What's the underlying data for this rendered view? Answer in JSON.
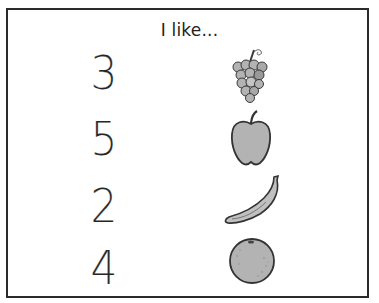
{
  "worksheet": {
    "title": "I like...",
    "rows": [
      {
        "number": "3",
        "fruit": "grapes",
        "icon": "grapes-icon"
      },
      {
        "number": "5",
        "fruit": "apple",
        "icon": "apple-icon"
      },
      {
        "number": "2",
        "fruit": "banana",
        "icon": "banana-icon"
      },
      {
        "number": "4",
        "fruit": "orange",
        "icon": "orange-icon"
      }
    ]
  },
  "colors": {
    "border": "#2b2b2b",
    "fruit_fill": "#b3b3b3",
    "fruit_stroke": "#3a3a3a"
  }
}
